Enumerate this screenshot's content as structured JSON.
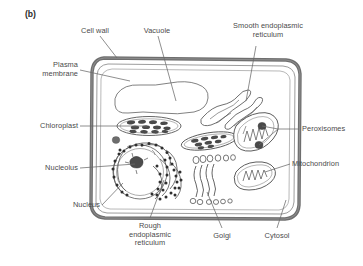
{
  "figure": {
    "panel_tag": "(b)",
    "caption_type": "plant-cell-diagram",
    "style": {
      "cell_wall_color": "#6e6e6e",
      "plasma_membrane_color": "#8a8a8a",
      "organelle_stroke": "#555555",
      "label_color": "#4a4a4a",
      "leader_color": "#6a6a6a",
      "background": "#ffffff",
      "dense_fill": "#4a4a4a"
    }
  },
  "labels": [
    {
      "id": "cell-wall",
      "text": "Cell wall",
      "x": 95,
      "y": 31,
      "align": "center"
    },
    {
      "id": "vacuole",
      "text": "Vacuole",
      "x": 157,
      "y": 31,
      "align": "center"
    },
    {
      "id": "smooth-er",
      "text": "Smooth endoplasmic\nreticulum",
      "x": 268,
      "y": 26,
      "align": "center"
    },
    {
      "id": "plasma-membrane",
      "text": "Plasma\nmembrane",
      "x": 76,
      "y": 62,
      "align": "right"
    },
    {
      "id": "chloroplast",
      "text": "Chloroplast",
      "x": 76,
      "y": 122,
      "align": "right"
    },
    {
      "id": "peroxisomes",
      "text": "Peroxisomes",
      "x": 302,
      "y": 125,
      "align": "left"
    },
    {
      "id": "mitochondrion",
      "text": "Mitochondrion",
      "x": 292,
      "y": 161,
      "align": "left"
    },
    {
      "id": "nucleolus",
      "text": "Nucleolus",
      "x": 76,
      "y": 164,
      "align": "right"
    },
    {
      "id": "nucleus",
      "text": "Nucleus",
      "x": 98,
      "y": 203,
      "align": "right"
    },
    {
      "id": "rough-er",
      "text": "Rough\nendoplasmic\nreticulum",
      "x": 150,
      "y": 224,
      "align": "center"
    },
    {
      "id": "golgi",
      "text": "Golgi",
      "x": 222,
      "y": 234,
      "align": "center"
    },
    {
      "id": "cytosol",
      "text": "Cytosol",
      "x": 277,
      "y": 234,
      "align": "center"
    }
  ],
  "organelles": [
    {
      "id": "cell-wall",
      "name": "cell wall",
      "count": 1
    },
    {
      "id": "plasma-membrane",
      "name": "plasma membrane",
      "count": 1
    },
    {
      "id": "vacuole",
      "name": "vacuole",
      "count": 1
    },
    {
      "id": "chloroplast",
      "name": "chloroplast",
      "count": 2
    },
    {
      "id": "nucleus",
      "name": "nucleus",
      "count": 1
    },
    {
      "id": "nucleolus",
      "name": "nucleolus",
      "count": 1
    },
    {
      "id": "rough-er",
      "name": "rough endoplasmic reticulum",
      "count": 1
    },
    {
      "id": "smooth-er",
      "name": "smooth endoplasmic reticulum",
      "count": 1
    },
    {
      "id": "golgi",
      "name": "Golgi apparatus",
      "count": 1
    },
    {
      "id": "mitochondrion",
      "name": "mitochondrion",
      "count": 2
    },
    {
      "id": "peroxisome",
      "name": "peroxisome",
      "count": 2
    },
    {
      "id": "cytosol",
      "name": "cytosol",
      "count": 1
    }
  ]
}
